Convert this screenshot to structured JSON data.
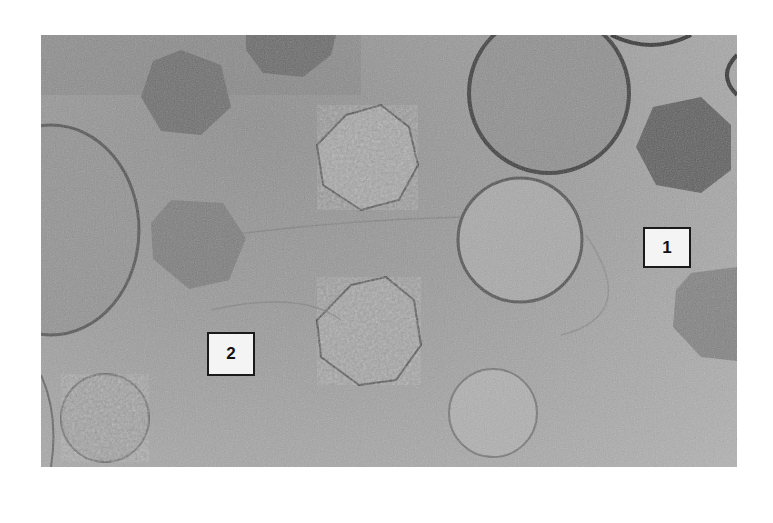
{
  "figure": {
    "labels": [
      {
        "id": "1",
        "text": "1"
      },
      {
        "id": "2",
        "text": "2"
      }
    ]
  }
}
